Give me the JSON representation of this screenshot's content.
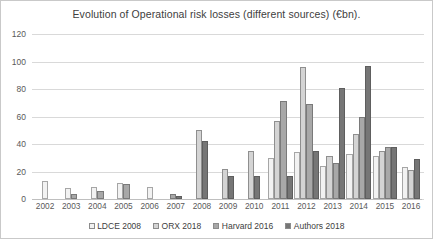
{
  "chart_data": {
    "type": "bar",
    "title": "Evolution of Operational risk losses (different sources) (€bn).",
    "xlabel": "",
    "ylabel": "",
    "ylim": [
      0,
      120
    ],
    "ytick_step": 20,
    "yticks": [
      0,
      20,
      40,
      60,
      80,
      100,
      120
    ],
    "grid": true,
    "legend_position": "bottom",
    "categories": [
      "2002",
      "2003",
      "2004",
      "2005",
      "2006",
      "2007",
      "2008",
      "2009",
      "2010",
      "2011",
      "2012",
      "2013",
      "2014",
      "2015",
      "2016"
    ],
    "series": [
      {
        "name": "LDCE 2008",
        "color": "#f2f2f2",
        "values": [
          13,
          8,
          9,
          12,
          9,
          null,
          null,
          null,
          null,
          30,
          34,
          24,
          33,
          31,
          23
        ]
      },
      {
        "name": "ORX 2018",
        "color": "#d4d4d4",
        "values": [
          null,
          null,
          null,
          null,
          null,
          null,
          50,
          22,
          35,
          57,
          96,
          31,
          47,
          35,
          21
        ]
      },
      {
        "name": "Harvard 2016",
        "color": "#a8a8a8",
        "values": [
          null,
          4,
          6,
          11,
          null,
          4,
          null,
          null,
          null,
          71,
          69,
          26,
          60,
          38,
          null
        ]
      },
      {
        "name": "Authors 2018",
        "color": "#767676",
        "values": [
          null,
          null,
          null,
          null,
          null,
          2,
          42,
          17,
          17,
          17,
          35,
          81,
          97,
          38,
          29
        ]
      }
    ]
  },
  "legend": {
    "items": [
      {
        "label": "LDCE 2008",
        "color": "#f2f2f2"
      },
      {
        "label": "ORX 2018",
        "color": "#d4d4d4"
      },
      {
        "label": "Harvard 2016",
        "color": "#a8a8a8"
      },
      {
        "label": "Authors 2018",
        "color": "#767676"
      }
    ]
  }
}
